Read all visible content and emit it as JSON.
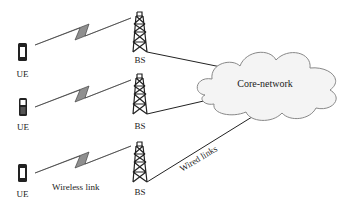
{
  "diagram": {
    "ues": [
      {
        "label": "UE"
      },
      {
        "label": "UE"
      },
      {
        "label": "UE"
      }
    ],
    "base_stations": [
      {
        "label": "BS"
      },
      {
        "label": "BS"
      },
      {
        "label": "BS"
      }
    ],
    "core": {
      "label": "Core-network"
    },
    "link_labels": {
      "wireless": "Wireless link",
      "wired": "Wired links"
    },
    "colors": {
      "lightning": "#8f8f8f",
      "cloud_fill": "#f4f4f4",
      "cloud_stroke": "#888888",
      "line": "#222222"
    }
  }
}
